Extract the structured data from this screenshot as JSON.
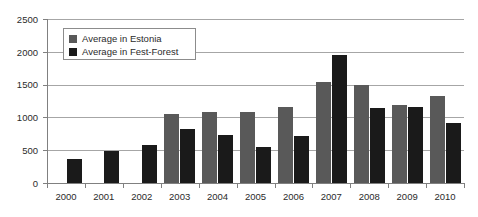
{
  "chart_data": {
    "type": "bar",
    "title": "",
    "xlabel": "",
    "ylabel": "",
    "ylim": [
      0,
      2500
    ],
    "yticks": [
      0,
      500,
      1000,
      1500,
      2000,
      2500
    ],
    "ytick_labels": [
      "0",
      "500",
      "1000",
      "1500",
      "2000",
      "2500"
    ],
    "grid": true,
    "legend_position": "top-left",
    "categories": [
      "2000",
      "2001",
      "2002",
      "2003",
      "2004",
      "2005",
      "2006",
      "2007",
      "2008",
      "2009",
      "2010"
    ],
    "series": [
      {
        "name": "Average in Estonia",
        "color": "#595959",
        "values": [
          null,
          null,
          null,
          1045,
          1090,
          1090,
          1165,
          1545,
          1500,
          1190,
          1330
        ]
      },
      {
        "name": "Average in Fest-Forest",
        "color": "#1a1a1a",
        "values": [
          365,
          490,
          580,
          830,
          740,
          555,
          720,
          1950,
          1145,
          1160,
          915
        ]
      }
    ]
  },
  "legend": {
    "items": [
      {
        "label": "Average in Estonia",
        "color": "#595959"
      },
      {
        "label": "Average in Fest-Forest",
        "color": "#1a1a1a"
      }
    ]
  },
  "colors": {
    "background": "#ffffff",
    "gridline": "#a6a6a6",
    "axis": "#808080",
    "text": "#2b2b2b",
    "series_estonia": "#595959",
    "series_fest_forest": "#1a1a1a"
  }
}
